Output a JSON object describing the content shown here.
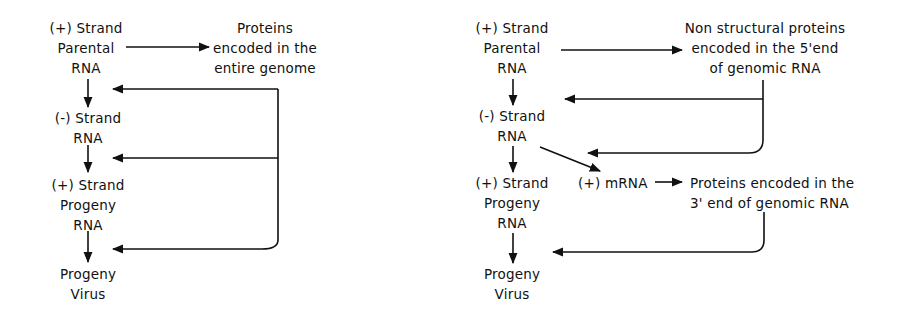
{
  "colors": {
    "ink": "#111111",
    "background": "#ffffff"
  },
  "left_diagram": {
    "nodes": {
      "parental_rna": [
        "(+) Strand",
        "Parental",
        "RNA"
      ],
      "minus_strand_rna": [
        "(-) Strand",
        "RNA"
      ],
      "plus_strand_progeny_rna": [
        "(+) Strand",
        "Progeny",
        "RNA"
      ],
      "progeny_virus": [
        "Progeny",
        "Virus"
      ],
      "proteins": [
        "Proteins",
        "encoded in the",
        "entire genome"
      ]
    }
  },
  "right_diagram": {
    "nodes": {
      "parental_rna": [
        "(+) Strand",
        "Parental",
        "RNA"
      ],
      "minus_strand_rna": [
        "(-) Strand",
        "RNA"
      ],
      "plus_strand_progeny_rna": [
        "(+) Strand",
        "Progeny",
        "RNA"
      ],
      "progeny_virus": [
        "Progeny",
        "Virus"
      ],
      "mrna": "(+) mRNA",
      "nonstructural_proteins": [
        "Non structural proteins",
        "encoded in the 5'end",
        "of genomic RNA"
      ],
      "proteins_3_end": [
        "Proteins encoded in the",
        "3' end of genomic RNA"
      ]
    }
  }
}
